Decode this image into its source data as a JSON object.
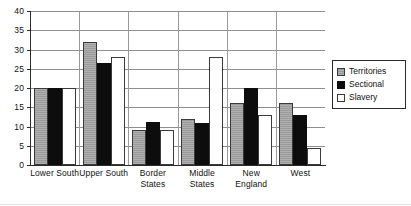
{
  "chart_data": {
    "type": "bar",
    "title": "",
    "subtitle": "",
    "xlabel": "",
    "ylabel": "",
    "ylim": [
      0,
      40
    ],
    "ytick_step": 5,
    "yticks": [
      0,
      5,
      10,
      15,
      20,
      25,
      30,
      35,
      40
    ],
    "ytick_labels": [
      "0",
      "5",
      "10",
      "15",
      "20",
      "25",
      "30",
      "35",
      "40"
    ],
    "grid": true,
    "grid_axis": "y",
    "legend_position": "right",
    "categories": [
      "Lower South",
      "Upper South",
      "Border States",
      "Middle States",
      "New England",
      "West"
    ],
    "category_lines": [
      [
        "Lower South"
      ],
      [
        "Upper South"
      ],
      [
        "Border",
        "States"
      ],
      [
        "Middle",
        "States"
      ],
      [
        "New England"
      ],
      [
        "West"
      ]
    ],
    "series": [
      {
        "name": "Territories",
        "color": "#9a9a9a",
        "pattern": "hatched-gray",
        "values": [
          20,
          32,
          9,
          12,
          16,
          16
        ]
      },
      {
        "name": "Sectional",
        "color": "#0d0d0d",
        "pattern": "solid-black",
        "values": [
          20,
          26.5,
          11.3,
          11,
          20,
          13
        ]
      },
      {
        "name": "Slavery",
        "color": "#ffffff",
        "pattern": "white-outline",
        "values": [
          20,
          28,
          9.2,
          28,
          13,
          4.5
        ]
      }
    ]
  },
  "legend": {
    "items": [
      {
        "label": "Territories",
        "swatch": "territories"
      },
      {
        "label": "Sectional",
        "swatch": "sectional"
      },
      {
        "label": "Slavery",
        "swatch": "slavery"
      }
    ]
  }
}
